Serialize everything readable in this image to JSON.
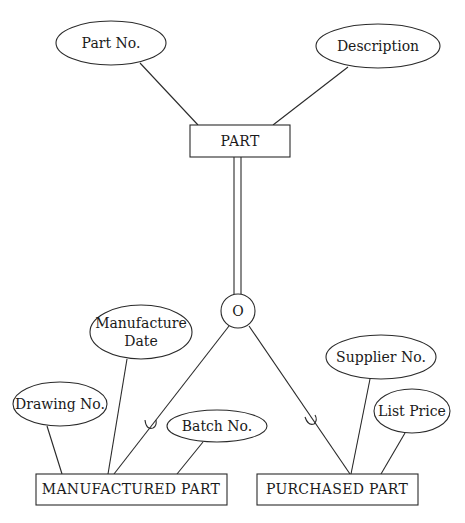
{
  "diagram": {
    "type": "EER diagram (specialization)",
    "superclass": {
      "name": "PART",
      "attributes": [
        "Part No.",
        "Description"
      ]
    },
    "specialization": {
      "constraint_symbol": "O",
      "constraint_meaning": "overlapping",
      "participation": "total (double line)"
    },
    "subclasses": [
      {
        "name": "MANUFACTURED PART",
        "attributes": [
          "Manufacture Date",
          "Drawing No.",
          "Batch No."
        ],
        "attribute_lines": {
          "manufacture_date_line1": "Manufacture",
          "manufacture_date_line2": "Date"
        }
      },
      {
        "name": "PURCHASED PART",
        "attributes": [
          "Supplier No.",
          "List Price"
        ]
      }
    ]
  },
  "labels": {
    "part": "PART",
    "part_no": "Part No.",
    "description": "Description",
    "overlap": "O",
    "manufactured_part": "MANUFACTURED PART",
    "purchased_part": "PURCHASED PART",
    "manufacture_date_1": "Manufacture",
    "manufacture_date_2": "Date",
    "drawing_no": "Drawing No.",
    "batch_no": "Batch No.",
    "supplier_no": "Supplier No.",
    "list_price": "List Price"
  }
}
